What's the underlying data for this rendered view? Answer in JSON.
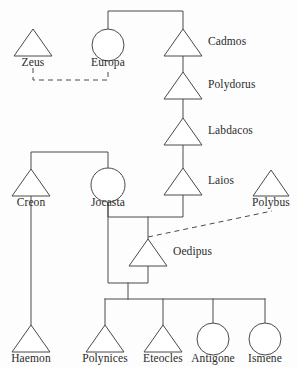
{
  "diagram": {
    "type": "genealogy-pedigree",
    "stroke_color": "#4a4a4a",
    "background_color": "#fdfdfd",
    "clipped_header_text": "",
    "shape_legend": {
      "triangle": "male",
      "circle": "female",
      "solid_line": "descent / marriage",
      "dashed_line": "non-biological or disputed relation"
    },
    "persons": [
      {
        "id": "zeus",
        "label": "Zeus",
        "shape": "triangle",
        "cx": 33,
        "cy": 43,
        "label_x": 33,
        "label_y": 57,
        "label_pos": "below"
      },
      {
        "id": "europa",
        "label": "Europa",
        "shape": "circle",
        "cx": 108,
        "cy": 43,
        "label_x": 108,
        "label_y": 57,
        "label_pos": "below"
      },
      {
        "id": "cadmos",
        "label": "Cadmos",
        "shape": "triangle",
        "cx": 183,
        "cy": 43,
        "label_x": 208,
        "label_y": 36,
        "label_pos": "right"
      },
      {
        "id": "polydorus",
        "label": "Polydorus",
        "shape": "triangle",
        "cx": 183,
        "cy": 86,
        "label_x": 208,
        "label_y": 79,
        "label_pos": "right"
      },
      {
        "id": "labdacos",
        "label": "Labdacos",
        "shape": "triangle",
        "cx": 183,
        "cy": 132,
        "label_x": 208,
        "label_y": 125,
        "label_pos": "right"
      },
      {
        "id": "laios",
        "label": "Laios",
        "shape": "triangle",
        "cx": 183,
        "cy": 182,
        "label_x": 208,
        "label_y": 175,
        "label_pos": "right"
      },
      {
        "id": "polybus",
        "label": "Polybus",
        "shape": "triangle",
        "cx": 271,
        "cy": 183,
        "label_x": 271,
        "label_y": 198,
        "label_pos": "below"
      },
      {
        "id": "creon",
        "label": "Creon",
        "shape": "triangle",
        "cx": 31,
        "cy": 183,
        "label_x": 31,
        "label_y": 198,
        "label_pos": "below"
      },
      {
        "id": "jocasta",
        "label": "Jocasta",
        "shape": "circle",
        "cx": 108,
        "cy": 183,
        "label_x": 108,
        "label_y": 198,
        "label_pos": "below"
      },
      {
        "id": "oedipus",
        "label": "Oedipus",
        "shape": "triangle",
        "cx": 148,
        "cy": 253,
        "label_x": 173,
        "label_y": 246,
        "label_pos": "right"
      },
      {
        "id": "haemon",
        "label": "Haemon",
        "shape": "triangle",
        "cx": 31,
        "cy": 339,
        "label_x": 31,
        "label_y": 354,
        "label_pos": "below"
      },
      {
        "id": "polynices",
        "label": "Polynices",
        "shape": "triangle",
        "cx": 105,
        "cy": 339,
        "label_x": 105,
        "label_y": 354,
        "label_pos": "below"
      },
      {
        "id": "eteocles",
        "label": "Eteocles",
        "shape": "triangle",
        "cx": 163,
        "cy": 339,
        "label_x": 163,
        "label_y": 354,
        "label_pos": "below"
      },
      {
        "id": "antigone",
        "label": "Antigone",
        "shape": "circle",
        "cx": 213,
        "cy": 339,
        "label_x": 213,
        "label_y": 354,
        "label_pos": "below"
      },
      {
        "id": "ismene",
        "label": "Ismene",
        "shape": "circle",
        "cx": 265,
        "cy": 339,
        "label_x": 265,
        "label_y": 354,
        "label_pos": "below"
      }
    ],
    "relations": [
      {
        "from": "zeus",
        "to": "europa",
        "style": "dashed",
        "kind": "union"
      },
      {
        "from": "europa",
        "to": "cadmos",
        "style": "solid",
        "kind": "union"
      },
      {
        "from": "cadmos",
        "to": "polydorus",
        "style": "solid",
        "kind": "descent"
      },
      {
        "from": "polydorus",
        "to": "labdacos",
        "style": "solid",
        "kind": "descent"
      },
      {
        "from": "labdacos",
        "to": "laios",
        "style": "solid",
        "kind": "descent"
      },
      {
        "from": "creon",
        "to": "jocasta",
        "style": "solid",
        "kind": "sibling"
      },
      {
        "from": "laios",
        "to": "jocasta",
        "style": "solid",
        "kind": "union"
      },
      {
        "from": "laios",
        "to": "oedipus",
        "style": "solid",
        "kind": "descent"
      },
      {
        "from": "polybus",
        "to": "oedipus",
        "style": "dashed",
        "kind": "foster"
      },
      {
        "from": "creon",
        "to": "haemon",
        "style": "solid",
        "kind": "descent"
      },
      {
        "from": "oedipus",
        "to": "polynices",
        "style": "solid",
        "kind": "descent"
      },
      {
        "from": "oedipus",
        "to": "eteocles",
        "style": "solid",
        "kind": "descent"
      },
      {
        "from": "oedipus",
        "to": "antigone",
        "style": "solid",
        "kind": "descent"
      },
      {
        "from": "oedipus",
        "to": "ismene",
        "style": "solid",
        "kind": "descent"
      }
    ]
  }
}
